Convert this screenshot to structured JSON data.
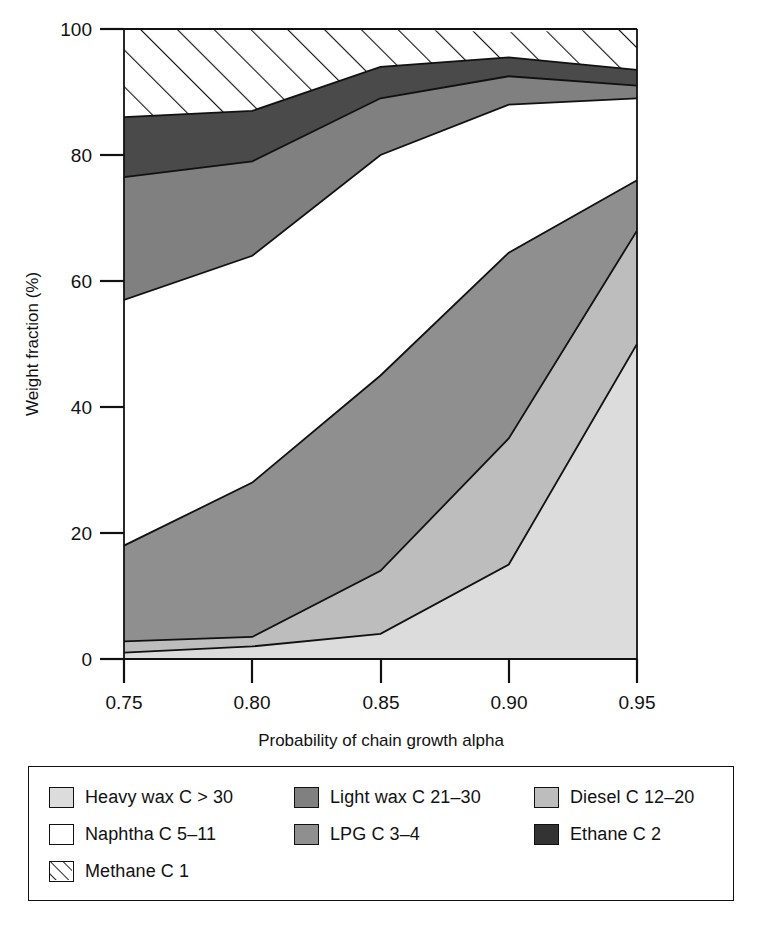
{
  "chart_data": {
    "type": "area",
    "title": "",
    "xlabel": "Probability of chain growth alpha",
    "ylabel": "Weight fraction (%)",
    "x": [
      0.75,
      0.8,
      0.85,
      0.9,
      0.95
    ],
    "xticks": [
      "0.75",
      "0.80",
      "0.85",
      "0.90",
      "0.95"
    ],
    "yticks": [
      "0",
      "20",
      "40",
      "60",
      "80",
      "100"
    ],
    "xlim": [
      0.75,
      0.95
    ],
    "ylim": [
      0,
      100
    ],
    "grid": false,
    "stacked": true,
    "stack_order_bottom_up": [
      "Heavy wax C > 30",
      "Diesel C 12-20",
      "LPG C 3-4",
      "Naphtha C 5-11",
      "Light wax C 21-30",
      "Ethane C 2",
      "Methane C 1"
    ],
    "series": [
      {
        "name": "Heavy wax C > 30",
        "fill": "#dcdcdc",
        "pattern": "solid",
        "values": [
          1.0,
          2.0,
          4.0,
          15.0,
          50.0
        ]
      },
      {
        "name": "Diesel C 12-20",
        "fill": "#bdbdbd",
        "pattern": "solid",
        "values": [
          1.8,
          1.5,
          10.0,
          20.0,
          18.0
        ]
      },
      {
        "name": "LPG C 3-4",
        "fill": "#8f8f8f",
        "pattern": "solid",
        "values": [
          15.2,
          24.5,
          31.0,
          29.5,
          8.0
        ]
      },
      {
        "name": "Naphtha C 5-11",
        "fill": "#ffffff",
        "pattern": "solid",
        "values": [
          39.0,
          36.0,
          35.0,
          23.5,
          13.0
        ]
      },
      {
        "name": "Light wax C 21-30",
        "fill": "#808080",
        "pattern": "solid",
        "values": [
          19.5,
          15.0,
          9.0,
          4.5,
          2.0
        ]
      },
      {
        "name": "Ethane C 2",
        "fill": "#4a4a4a",
        "pattern": "solid",
        "values": [
          9.5,
          8.0,
          5.0,
          3.0,
          2.5
        ]
      },
      {
        "name": "Methane C 1",
        "fill": "#ffffff",
        "pattern": "hatch",
        "values": [
          14.0,
          13.0,
          6.0,
          4.0,
          6.5
        ]
      }
    ],
    "cumulative_upper_bounds": {
      "Heavy wax C > 30": [
        1.0,
        2.0,
        4.0,
        15.0,
        50.0
      ],
      "Diesel C 12-20": [
        2.8,
        3.5,
        14.0,
        35.0,
        68.0
      ],
      "LPG C 3-4": [
        18.0,
        28.0,
        45.0,
        64.5,
        76.0
      ],
      "Naphtha C 5-11": [
        57.0,
        64.0,
        80.0,
        88.0,
        89.0
      ],
      "Light wax C 21-30": [
        76.5,
        79.0,
        89.0,
        92.5,
        91.0
      ],
      "Ethane C 2": [
        86.0,
        87.0,
        94.0,
        95.5,
        93.5
      ],
      "Methane C 1": [
        100.0,
        100.0,
        100.0,
        100.0,
        100.0
      ]
    }
  },
  "axes": {
    "y_title": "Weight fraction (%)",
    "x_title": "Probability of chain growth alpha",
    "y_tick_labels": [
      "100",
      "80",
      "60",
      "40",
      "20",
      "0"
    ],
    "x_tick_labels": [
      "0.75",
      "0.80",
      "0.85",
      "0.90",
      "0.95"
    ]
  },
  "legend": {
    "rows": [
      [
        {
          "label": "Heavy wax C > 30",
          "swatch": "swatch-heavy-wax",
          "fill": "#dcdcdc",
          "pattern": "solid"
        },
        {
          "label": "Light wax C 21–30",
          "swatch": "swatch-light-wax",
          "fill": "#808080",
          "pattern": "solid"
        },
        {
          "label": "Diesel C 12–20",
          "swatch": "swatch-diesel",
          "fill": "#bdbdbd",
          "pattern": "solid"
        }
      ],
      [
        {
          "label": "Naphtha C 5–11",
          "swatch": "swatch-naphtha",
          "fill": "#ffffff",
          "pattern": "solid"
        },
        {
          "label": "LPG C 3–4",
          "swatch": "swatch-lpg",
          "fill": "#8f8f8f",
          "pattern": "solid"
        },
        {
          "label": "Ethane C 2",
          "swatch": "swatch-ethane",
          "fill": "#333333",
          "pattern": "solid"
        }
      ],
      [
        {
          "label": "Methane C 1",
          "swatch": "swatch-methane",
          "fill": "#ffffff",
          "pattern": "hatch"
        }
      ]
    ]
  },
  "colors": {
    "heavy_wax": "#dcdcdc",
    "diesel": "#bdbdbd",
    "lpg": "#8f8f8f",
    "naphtha": "#ffffff",
    "light_wax": "#808080",
    "ethane": "#4a4a4a",
    "methane": "#ffffff",
    "axis": "#111111"
  }
}
